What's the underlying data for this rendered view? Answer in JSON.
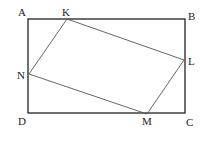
{
  "diagram": {
    "rectangle": {
      "A": [
        28,
        19
      ],
      "B": [
        185,
        19
      ],
      "C": [
        185,
        113
      ],
      "D": [
        28,
        113
      ]
    },
    "inner": {
      "K": [
        67,
        19
      ],
      "L": [
        184,
        60
      ],
      "M": [
        147,
        114
      ],
      "N": [
        29,
        74
      ]
    },
    "labels": {
      "A": "A",
      "B": "B",
      "C": "C",
      "D": "D",
      "K": "K",
      "L": "L",
      "M": "M",
      "N": "N"
    },
    "colors": {
      "outer": "#222222",
      "inner": "#555555"
    }
  }
}
